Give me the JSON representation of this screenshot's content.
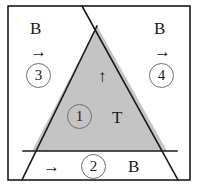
{
  "figure": {
    "background_color": "#ffffff",
    "frame_color": "#1a1a1a",
    "line_color": "#1a1a1a",
    "triangle_fill": "#c4c4c4",
    "circle_outline_color": "#6e6e6e",
    "text_color": "#1a1a1a"
  },
  "regions": {
    "inner_triangle": {
      "number": "1",
      "letter": "T",
      "arrow": "↑"
    },
    "bottom_strip": {
      "number": "2",
      "letter": "B",
      "arrow": "→"
    },
    "left_outer": {
      "number": "3",
      "letter": "B",
      "arrow": "→"
    },
    "right_outer": {
      "number": "4",
      "letter": "B",
      "arrow": "→"
    }
  },
  "geometry": {
    "frame": {
      "x": 8,
      "y": 6,
      "width": 182,
      "height": 174
    },
    "triangle_apex": {
      "x": 97,
      "y": 26
    },
    "triangle_bottom_left": {
      "x": 32,
      "y": 151
    },
    "triangle_bottom_right": {
      "x": 167,
      "y": 151
    },
    "left_line_bottom": {
      "x": 22,
      "y": 180
    },
    "right_line_bottom": {
      "x": 178,
      "y": 180
    },
    "right_line_top": {
      "x": 82,
      "y": 6
    },
    "divider_y": 151
  }
}
